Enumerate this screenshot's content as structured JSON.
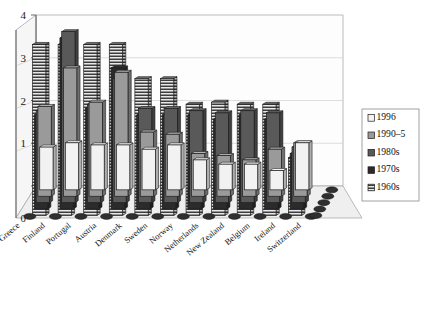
{
  "chart_data": {
    "type": "bar",
    "title": "",
    "subtitle": "",
    "xlabel": "",
    "ylabel": "",
    "ylim": [
      0,
      4
    ],
    "yticks": [
      0,
      1,
      2,
      3,
      4
    ],
    "ytick_labels": [
      "0",
      "1",
      "2",
      "3",
      "4"
    ],
    "grid": true,
    "projection": "3d-clustered-columns",
    "legend_position": "right",
    "categories": [
      "Greece",
      "Finland",
      "Portugal",
      "Austria",
      "Denmark",
      "Sweden",
      "Norway",
      "Netherlands",
      "New Zealand",
      "Belgium",
      "Ireland",
      "Switzerland"
    ],
    "series": [
      {
        "name": "1996",
        "color": "#f2f2f2",
        "pattern": "solid-white",
        "values": [
          1.0,
          1.1,
          1.05,
          1.05,
          0.95,
          1.05,
          0.7,
          0.6,
          0.6,
          0.45,
          1.1,
          0.0
        ]
      },
      {
        "name": "1990-5",
        "color": "#9a9a9a",
        "pattern": "solid-grey",
        "values": [
          2.1,
          3.0,
          2.2,
          2.9,
          1.5,
          1.45,
          1.0,
          0.95,
          0.85,
          1.1,
          1.25,
          0.0
        ]
      },
      {
        "name": "1980s",
        "color": "#595959",
        "pattern": "solid-dark-grey",
        "values": [
          2.15,
          4.0,
          2.3,
          2.9,
          2.2,
          2.2,
          2.15,
          2.1,
          2.15,
          2.1,
          1.3,
          0.0
        ]
      },
      {
        "name": "1970s",
        "color": "#2b2b2b",
        "pattern": "solid-black",
        "values": [
          2.2,
          4.0,
          2.35,
          3.3,
          2.2,
          2.2,
          2.2,
          2.1,
          2.2,
          2.1,
          1.3,
          0.0
        ]
      },
      {
        "name": "1960s",
        "color": "#404040",
        "pattern": "horizontal-hatch",
        "values": [
          4.0,
          4.0,
          4.0,
          4.0,
          3.2,
          3.2,
          2.6,
          2.65,
          2.6,
          2.6,
          1.35,
          0.0
        ]
      }
    ]
  },
  "legend": {
    "entries": [
      {
        "label": "1996"
      },
      {
        "label": "1990–5"
      },
      {
        "label": "1980s"
      },
      {
        "label": "1970s"
      },
      {
        "label": "1960s"
      }
    ]
  },
  "axes": {
    "y_tick_0": "0",
    "y_tick_1": "1",
    "y_tick_2": "2",
    "y_tick_3": "3",
    "y_tick_4": "4"
  },
  "colors": {
    "plot_background": "#ffffff",
    "wall_back": "#ffffff",
    "wall_side": "#f5f5f5",
    "floor": "#ededed",
    "axis_line": "#6b6b6b",
    "grid_line": "#c9c9c9",
    "border": "#7a7a7a",
    "series_1996": "#f2f2f2",
    "series_1990_5": "#9a9a9a",
    "series_1980s": "#595959",
    "series_1970s": "#2b2b2b",
    "series_1960s": "#404040"
  }
}
